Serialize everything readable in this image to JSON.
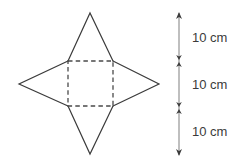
{
  "figure": {
    "background_color": "#ffffff",
    "stroke_color": "#3b3b3b",
    "dashed_stroke_color": "#4a4a4a",
    "net": {
      "base": {
        "shape_name": "square-base",
        "style": "dashed",
        "corners": [
          {
            "x": 68,
            "y": 61
          },
          {
            "x": 113,
            "y": 61
          },
          {
            "x": 113,
            "y": 106
          },
          {
            "x": 68,
            "y": 106
          }
        ]
      },
      "triangles": [
        {
          "name": "top-triangle",
          "apex": {
            "x": 90,
            "y": 13
          },
          "base_start": {
            "x": 68,
            "y": 61
          },
          "base_end": {
            "x": 113,
            "y": 61
          }
        },
        {
          "name": "right-triangle",
          "apex": {
            "x": 159,
            "y": 84
          },
          "base_start": {
            "x": 113,
            "y": 61
          },
          "base_end": {
            "x": 113,
            "y": 106
          }
        },
        {
          "name": "bottom-triangle",
          "apex": {
            "x": 90,
            "y": 154
          },
          "base_start": {
            "x": 113,
            "y": 106
          },
          "base_end": {
            "x": 68,
            "y": 106
          }
        },
        {
          "name": "left-triangle",
          "apex": {
            "x": 19,
            "y": 84
          },
          "base_start": {
            "x": 68,
            "y": 106
          },
          "base_end": {
            "x": 68,
            "y": 61
          }
        }
      ]
    },
    "scale": {
      "name": "dimension-ruler",
      "axis_x": 179,
      "top_y": 13,
      "bottom_y": 155,
      "tick_positions": [
        13,
        61,
        108,
        155
      ],
      "segments": [
        {
          "label": "10 cm",
          "top_y": 13,
          "bottom_y": 61
        },
        {
          "label": "10 cm",
          "top_y": 61,
          "bottom_y": 108
        },
        {
          "label": "10 cm",
          "top_y": 108,
          "bottom_y": 155
        }
      ]
    }
  }
}
